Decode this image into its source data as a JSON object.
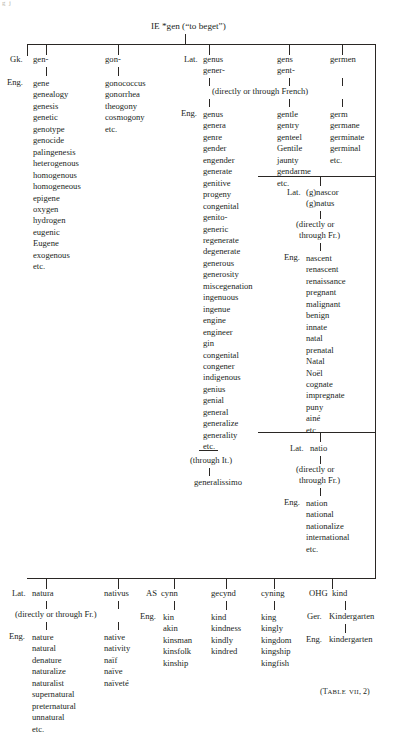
{
  "page": {
    "ghost_artifact": "g  j",
    "caption": "(TABLE VII, 2)",
    "caption_main": "(T",
    "caption_small1": "ABLE",
    "caption_small2": "VII",
    "caption_tail": ", 2)"
  },
  "root": {
    "label": "IE *gen (“to beget”)"
  },
  "connectors": {
    "directly_french": "(directly or through French)",
    "directly_fr": "(directly or through Fr.)",
    "directly_or": "(directly or",
    "through_fr": "through Fr.)",
    "through_it": "(through It.)"
  },
  "lang_labels": {
    "gk": "Gk.",
    "eng": "Eng.",
    "lat": "Lat.",
    "ger": "Ger.",
    "as": "AS",
    "ohg": "OHG"
  },
  "columns": {
    "gen": {
      "lang": "Gk.",
      "root": "gen-",
      "eng_label": "Eng.",
      "words": [
        "gene",
        "genealogy",
        "genesis",
        "genetic",
        "genotype",
        "genocide",
        "palingenesis",
        "heterogenous",
        "homogenous",
        "homogeneous",
        "epigene",
        "oxygen",
        "hydrogen",
        "eugenic",
        "Eugene",
        "exogenous",
        "etc."
      ]
    },
    "gon": {
      "root": "gon-",
      "words": [
        "gonococcus",
        "gonorrhea",
        "theogony",
        "cosmogony",
        "etc."
      ]
    },
    "genus": {
      "lang": "Lat.",
      "root1": "genus",
      "root2": "gener-",
      "eng_label": "Eng.",
      "words": [
        "genus",
        "genera",
        "genre",
        "gender",
        "engender",
        "generate",
        "genitive",
        "progeny",
        "congenital",
        "genito-",
        "generic",
        "regenerate",
        "degenerate",
        "generous",
        "generosity",
        "miscegenation",
        "ingenuous",
        "ingenue",
        "engine",
        "engineer",
        "gin",
        "congenital",
        "congener",
        "indigenous",
        "genius",
        "genial",
        "general",
        "generalize",
        "generality",
        "etc."
      ],
      "italian_word": "generalissimo"
    },
    "gens": {
      "root1": "gens",
      "root2": "gent-",
      "words": [
        "gentle",
        "gentry",
        "genteel",
        "Gentile",
        "jaunty",
        "gendarme",
        "etc."
      ]
    },
    "germen": {
      "root1": "germen",
      "words": [
        "germ",
        "germane",
        "germinate",
        "germinal",
        "etc."
      ]
    },
    "nascor": {
      "lang": "Lat.",
      "root1": "(g)nascor",
      "root2": "(g)natus",
      "eng_label": "Eng.",
      "words": [
        "nascent",
        "renascent",
        "renaissance",
        "pregnant",
        "malignant",
        "benign",
        "innate",
        "natal",
        "prenatal",
        "Natal",
        "Noël",
        "cognate",
        "impregnate",
        "puny",
        "ainé",
        "etc."
      ]
    },
    "natio": {
      "lang": "Lat.",
      "root1": "natio",
      "eng_label": "Eng.",
      "words": [
        "nation",
        "national",
        "nationalize",
        "international",
        "etc."
      ]
    },
    "natura": {
      "lang": "Lat.",
      "root1": "natura",
      "eng_label": "Eng.",
      "words": [
        "nature",
        "natural",
        "denature",
        "naturalize",
        "naturalist",
        "supernatural",
        "preternatural",
        "unnatural",
        "etc."
      ]
    },
    "nativus": {
      "root1": "nativus",
      "words": [
        "native",
        "nativity",
        "naïf",
        "naïve",
        "naïveté"
      ]
    },
    "cynn": {
      "lang": "AS",
      "root1": "cynn",
      "eng_label": "Eng.",
      "words": [
        "kin",
        "akin",
        "kinsman",
        "kinsfolk",
        "kinship"
      ]
    },
    "gecynd": {
      "root1": "gecynd",
      "words": [
        "kind",
        "kindness",
        "kindly",
        "kindred"
      ]
    },
    "cyning": {
      "root1": "cyning",
      "words": [
        "king",
        "kingly",
        "kingdom",
        "kingship",
        "kingfish"
      ]
    },
    "kind_ohg": {
      "lang": "OHG",
      "root1": "kind",
      "ger_label": "Ger.",
      "ger_word": "Kindergarten",
      "eng_label": "Eng.",
      "eng_word": "kindergarten"
    }
  }
}
